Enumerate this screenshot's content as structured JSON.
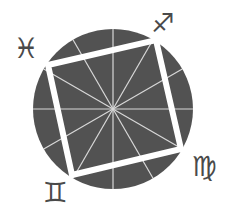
{
  "diagram": {
    "colors": {
      "background": "#ffffff",
      "wheel_fill": "#525252",
      "radial_lines": "#d8d8d8",
      "square_stroke": "#ffffff",
      "glyph": "#4a4a4a"
    },
    "wheel": {
      "cx": 113,
      "cy": 109,
      "r": 80,
      "divisions": 12
    },
    "square": {
      "vertices": [
        [
          48,
          65
        ],
        [
          156,
          40
        ],
        [
          181,
          149
        ],
        [
          72,
          175
        ]
      ],
      "stroke_width": 6
    },
    "signs": [
      {
        "name": "Pisces",
        "glyph": "♓",
        "x": 26,
        "y": 50,
        "size": 28
      },
      {
        "name": "Sagittarius",
        "glyph": "♐",
        "x": 163,
        "y": 24,
        "size": 26
      },
      {
        "name": "Virgo",
        "glyph": "♍",
        "x": 204,
        "y": 168,
        "size": 28
      },
      {
        "name": "Gemini",
        "glyph": "♊",
        "x": 55,
        "y": 194,
        "size": 28
      }
    ]
  }
}
